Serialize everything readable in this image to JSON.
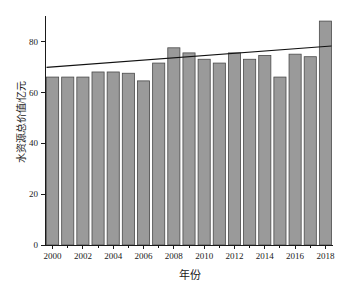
{
  "chart_data": {
    "type": "bar",
    "title": "",
    "xlabel": "年份",
    "ylabel": "水资源总价值/亿元",
    "categories": [
      2000,
      2001,
      2002,
      2003,
      2004,
      2005,
      2006,
      2007,
      2008,
      2009,
      2010,
      2011,
      2012,
      2013,
      2014,
      2015,
      2016,
      2017,
      2018
    ],
    "values": [
      66,
      66,
      66,
      68,
      68,
      67.5,
      64.5,
      71.5,
      77.5,
      75.5,
      73,
      71.5,
      75.5,
      73,
      74.5,
      66,
      75,
      74,
      88
    ],
    "series": [
      {
        "name": "水资源总价值",
        "type": "bar",
        "values": [
          66,
          66,
          66,
          68,
          68,
          67.5,
          64.5,
          71.5,
          77.5,
          75.5,
          73,
          71.5,
          75.5,
          73,
          74.5,
          66,
          75,
          74,
          88
        ]
      },
      {
        "name": "趋势线",
        "type": "line",
        "x": [
          2000,
          2018
        ],
        "values": [
          69.8,
          78.2
        ]
      }
    ],
    "xlim": [
      1999.5,
      2018.5
    ],
    "ylim": [
      0,
      90
    ],
    "yticks": [
      0,
      20,
      40,
      60,
      80
    ],
    "ytick_labels": [
      "0",
      "20",
      "40",
      "60",
      "80"
    ],
    "xticks": [
      2000,
      2002,
      2004,
      2006,
      2008,
      2010,
      2012,
      2014,
      2016,
      2018
    ],
    "xtick_labels": [
      "2000",
      "2002",
      "2004",
      "2006",
      "2008",
      "2010",
      "2012",
      "2014",
      "2016",
      "2018"
    ],
    "minor_xticks": [
      2001,
      2003,
      2005,
      2007,
      2009,
      2011,
      2013,
      2015,
      2017
    ],
    "grid": false,
    "legend": "none",
    "colors": {
      "bar_fill": "#9a9a9a",
      "bar_stroke": "#4a4a4a",
      "trend_line": "#111111",
      "axis": "#1a1a1a",
      "background": "#ffffff"
    }
  }
}
